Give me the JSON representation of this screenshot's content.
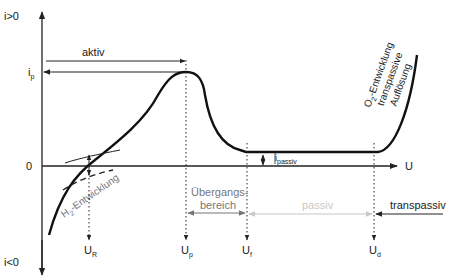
{
  "diagram": {
    "type": "current-density-potential curve (passivation)",
    "axes": {
      "y_top": "i>0",
      "y_bottom": "i<0",
      "origin": "0",
      "x": "U",
      "ip": "i",
      "ip_sub": "p"
    },
    "regions": {
      "aktiv": "aktiv",
      "uebergang_line1": "Übergangs-",
      "uebergang_line2": "bereich",
      "passiv": "passiv",
      "transpassiv": "transpassiv"
    },
    "annotations": {
      "h2": "H",
      "h2_sub": "2",
      "h2_rest": "-Entwicklung",
      "o2_line1_a": "O",
      "o2_line1_sub": "2",
      "o2_line1_b": "-Entwicklung",
      "o2_line2": "transpassive",
      "o2_line3": "Auflösung",
      "ipassiv": "i",
      "ipassiv_sub": "passiv"
    },
    "potentials": [
      {
        "main": "U",
        "sub": "R"
      },
      {
        "main": "U",
        "sub": "p"
      },
      {
        "main": "U",
        "sub": "f"
      },
      {
        "main": "U",
        "sub": "d"
      }
    ],
    "colors": {
      "curve": "#111111",
      "axis": "#222222",
      "uebergang": "#777777",
      "passiv": "#c8c8c8"
    }
  }
}
